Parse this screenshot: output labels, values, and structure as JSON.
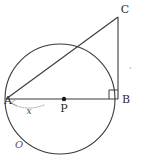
{
  "figure": {
    "type": "geometry-diagram",
    "background_color": "#ffffff",
    "stroke_color": "#3a3a3a",
    "width": 141,
    "height": 161,
    "labels": {
      "vertex_a": "A",
      "vertex_b": "B",
      "vertex_c": "C",
      "point_p": "P",
      "circle_center": "O",
      "angle_x": "x"
    },
    "geometry": {
      "circle": {
        "cx": 60,
        "cy": 99,
        "r": 55
      },
      "points": {
        "A": {
          "x": 6,
          "y": 99
        },
        "B": {
          "x": 118,
          "y": 99
        },
        "C": {
          "x": 118,
          "y": 17
        },
        "P": {
          "x": 64,
          "y": 99
        }
      },
      "segments": [
        {
          "name": "AB",
          "from": "A",
          "to": "B"
        },
        {
          "name": "AC",
          "from": "A",
          "to": "C"
        },
        {
          "name": "CB",
          "from": "C",
          "to": "B"
        }
      ],
      "right_angle_at": "B",
      "angle_arc_at": "A",
      "angle_arc_style": "dotted"
    }
  }
}
